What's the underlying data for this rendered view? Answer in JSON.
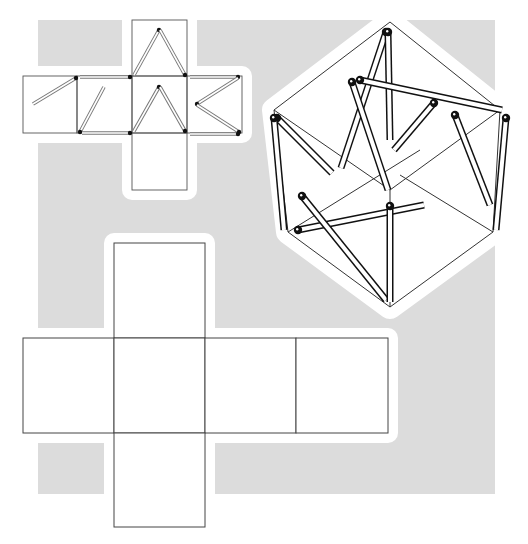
{
  "colors": {
    "background": "#ffffff",
    "panel_gray": "#dcdcdc",
    "line": "#333333",
    "match_body": "#ffffff",
    "match_outline_small": "#777777",
    "match_outline_large": "#111111",
    "match_head": "#111111"
  },
  "figure": {
    "gray_panel": {
      "x": 38,
      "y": 20,
      "w": 457,
      "h": 474
    },
    "small_net": {
      "faces": [
        {
          "name": "top",
          "x": 132,
          "y": 20,
          "w": 55,
          "h": 56
        },
        {
          "name": "left",
          "x": 23,
          "y": 76,
          "w": 54,
          "h": 57
        },
        {
          "name": "center-left",
          "x": 77,
          "y": 76,
          "w": 55,
          "h": 57
        },
        {
          "name": "center",
          "x": 132,
          "y": 76,
          "w": 55,
          "h": 57
        },
        {
          "name": "right",
          "x": 187,
          "y": 76,
          "w": 55,
          "h": 57
        },
        {
          "name": "bottom",
          "x": 132,
          "y": 133,
          "w": 55,
          "h": 57
        }
      ],
      "matches": [
        {
          "x1": 33,
          "y1": 104,
          "x2": 76,
          "y2": 78
        },
        {
          "x1": 80,
          "y1": 77,
          "x2": 130,
          "y2": 77
        },
        {
          "x1": 104,
          "y1": 87,
          "x2": 80,
          "y2": 132
        },
        {
          "x1": 82,
          "y1": 133,
          "x2": 130,
          "y2": 133
        },
        {
          "x1": 134,
          "y1": 75,
          "x2": 159,
          "y2": 30
        },
        {
          "x1": 160,
          "y1": 30,
          "x2": 185,
          "y2": 75
        },
        {
          "x1": 134,
          "y1": 131,
          "x2": 159,
          "y2": 87
        },
        {
          "x1": 160,
          "y1": 87,
          "x2": 185,
          "y2": 131
        },
        {
          "x1": 190,
          "y1": 77,
          "x2": 238,
          "y2": 77
        },
        {
          "x1": 238,
          "y1": 78,
          "x2": 197,
          "y2": 104
        },
        {
          "x1": 197,
          "y1": 105,
          "x2": 239,
          "y2": 132
        },
        {
          "x1": 190,
          "y1": 134,
          "x2": 238,
          "y2": 134
        }
      ]
    },
    "cube_view": {
      "hexagon": [
        [
          390,
          22
        ],
        [
          500,
          110
        ],
        [
          493,
          232
        ],
        [
          390,
          307
        ],
        [
          288,
          232
        ],
        [
          274,
          110
        ]
      ],
      "inner_lines": [
        [
          [
            274,
            110
          ],
          [
            390,
            190
          ]
        ],
        [
          [
            390,
            190
          ],
          [
            500,
            110
          ]
        ],
        [
          [
            390,
            190
          ],
          [
            390,
            307
          ]
        ],
        [
          [
            288,
            232
          ],
          [
            420,
            150
          ]
        ],
        [
          [
            400,
            175
          ],
          [
            493,
            232
          ]
        ]
      ],
      "matches": [
        {
          "x1": 386,
          "y1": 32,
          "x2": 341,
          "y2": 168
        },
        {
          "x1": 388,
          "y1": 32,
          "x2": 390,
          "y2": 140
        },
        {
          "x1": 360,
          "y1": 80,
          "x2": 502,
          "y2": 110
        },
        {
          "x1": 352,
          "y1": 82,
          "x2": 388,
          "y2": 190
        },
        {
          "x1": 434,
          "y1": 103,
          "x2": 394,
          "y2": 150
        },
        {
          "x1": 455,
          "y1": 115,
          "x2": 490,
          "y2": 205
        },
        {
          "x1": 277,
          "y1": 118,
          "x2": 332,
          "y2": 173
        },
        {
          "x1": 274,
          "y1": 118,
          "x2": 284,
          "y2": 230
        },
        {
          "x1": 506,
          "y1": 118,
          "x2": 496,
          "y2": 230
        },
        {
          "x1": 298,
          "y1": 230,
          "x2": 424,
          "y2": 205
        },
        {
          "x1": 302,
          "y1": 196,
          "x2": 386,
          "y2": 300
        },
        {
          "x1": 390,
          "y1": 206,
          "x2": 390,
          "y2": 302
        }
      ]
    },
    "large_net": {
      "faces": [
        {
          "name": "top",
          "x": 114,
          "y": 243,
          "w": 91,
          "h": 95
        },
        {
          "name": "left",
          "x": 23,
          "y": 338,
          "w": 91,
          "h": 95
        },
        {
          "name": "center",
          "x": 114,
          "y": 338,
          "w": 91,
          "h": 95
        },
        {
          "name": "right",
          "x": 205,
          "y": 338,
          "w": 91,
          "h": 95
        },
        {
          "name": "far-right",
          "x": 296,
          "y": 338,
          "w": 92,
          "h": 95
        },
        {
          "name": "bottom",
          "x": 114,
          "y": 433,
          "w": 91,
          "h": 94
        }
      ]
    }
  }
}
